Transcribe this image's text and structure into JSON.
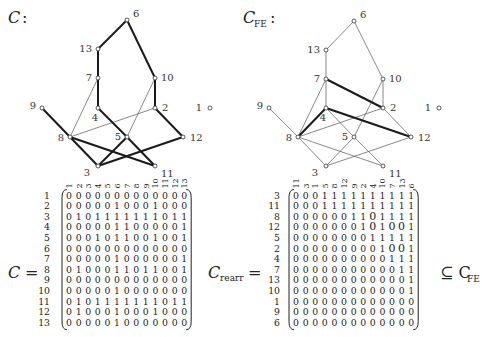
{
  "left_graph": {
    "title": "C",
    "title_suffix": ":",
    "nodes": [
      {
        "id": "6",
        "x": 127,
        "y": 20
      },
      {
        "id": "13",
        "x": 98,
        "y": 49
      },
      {
        "id": "7",
        "x": 98,
        "y": 78
      },
      {
        "id": "10",
        "x": 155,
        "y": 78
      },
      {
        "id": "9",
        "x": 42,
        "y": 108
      },
      {
        "id": "4",
        "x": 98,
        "y": 108
      },
      {
        "id": "2",
        "x": 155,
        "y": 108
      },
      {
        "id": "1",
        "x": 210,
        "y": 108
      },
      {
        "id": "8",
        "x": 70,
        "y": 137
      },
      {
        "id": "5",
        "x": 127,
        "y": 137
      },
      {
        "id": "12",
        "x": 183,
        "y": 137
      },
      {
        "id": "3",
        "x": 98,
        "y": 166
      },
      {
        "id": "11",
        "x": 155,
        "y": 166
      }
    ],
    "thick_edges": [
      [
        "6",
        "13"
      ],
      [
        "13",
        "7"
      ],
      [
        "7",
        "4"
      ],
      [
        "6",
        "10"
      ],
      [
        "10",
        "2"
      ],
      [
        "9",
        "8"
      ],
      [
        "4",
        "5"
      ],
      [
        "5",
        "11"
      ],
      [
        "2",
        "12"
      ],
      [
        "8",
        "3"
      ],
      [
        "8",
        "11"
      ],
      [
        "5",
        "3"
      ],
      [
        "3",
        "12"
      ]
    ],
    "thin_edges": [
      [
        "7",
        "8"
      ],
      [
        "8",
        "2"
      ],
      [
        "10",
        "5"
      ]
    ]
  },
  "right_graph": {
    "title": "C",
    "title_subscript": "FE",
    "title_suffix": ":",
    "nodes": [
      {
        "id": "6",
        "x": 354,
        "y": 21
      },
      {
        "id": "13",
        "x": 326,
        "y": 50
      },
      {
        "id": "7",
        "x": 326,
        "y": 79
      },
      {
        "id": "10",
        "x": 383,
        "y": 79
      },
      {
        "id": "9",
        "x": 269,
        "y": 108
      },
      {
        "id": "4",
        "x": 326,
        "y": 108
      },
      {
        "id": "2",
        "x": 383,
        "y": 108
      },
      {
        "id": "1",
        "x": 439,
        "y": 108
      },
      {
        "id": "8",
        "x": 298,
        "y": 137
      },
      {
        "id": "5",
        "x": 354,
        "y": 137
      },
      {
        "id": "12",
        "x": 411,
        "y": 137
      },
      {
        "id": "3",
        "x": 326,
        "y": 166
      },
      {
        "id": "11",
        "x": 383,
        "y": 166
      }
    ],
    "thick_edges": [
      [
        "7",
        "2"
      ],
      [
        "4",
        "12"
      ],
      [
        "4",
        "8"
      ]
    ],
    "thin_edges": [
      [
        "6",
        "13"
      ],
      [
        "6",
        "10"
      ],
      [
        "13",
        "7"
      ],
      [
        "7",
        "4"
      ],
      [
        "7",
        "8"
      ],
      [
        "10",
        "2"
      ],
      [
        "9",
        "8"
      ],
      [
        "4",
        "5"
      ],
      [
        "5",
        "11"
      ],
      [
        "8",
        "2"
      ],
      [
        "8",
        "3"
      ],
      [
        "8",
        "11"
      ],
      [
        "3",
        "12"
      ],
      [
        "2",
        "12"
      ],
      [
        "5",
        "3"
      ],
      [
        "10",
        "5"
      ]
    ]
  },
  "left_matrix": {
    "lhs": "C",
    "eq": "=",
    "col_labels": [
      "1",
      "2",
      "3",
      "4",
      "5",
      "6",
      "7",
      "8",
      "9",
      "10",
      "11",
      "12",
      "13"
    ],
    "row_labels": [
      "1",
      "2",
      "3",
      "4",
      "5",
      "6",
      "7",
      "8",
      "9",
      "10",
      "11",
      "12",
      "13"
    ],
    "rows": [
      "0000000000000",
      "0000010001000",
      "0101111111011",
      "0000011000001",
      "0001011001001",
      "0000000000000",
      "0000010000001",
      "0100011011001",
      "0000000000000",
      "0000010000000",
      "0101111111011",
      "0100010001000",
      "0000010000000"
    ]
  },
  "right_matrix": {
    "lhs": "C",
    "lhs_subscript": "rearr",
    "eq": "=",
    "rhs": "⊆ C",
    "rhs_subscript": "FE",
    "col_labels": [
      "11",
      "3",
      "1",
      "5",
      "8",
      "12",
      "9",
      "2",
      "4",
      "10",
      "7",
      "13",
      "6"
    ],
    "row_labels": [
      "3",
      "11",
      "8",
      "12",
      "5",
      "2",
      "4",
      "7",
      "13",
      "10",
      "1",
      "9",
      "6"
    ],
    "rows": [
      "0001111111111",
      "0001111111111",
      "000000110O1111",
      "0000000101O1OO1",
      "0000000001111 1",
      "00000000001OO1",
      "0000000000111",
      "0000000000011",
      "0000000000001",
      "0000000000001",
      "0000000000000",
      "0000000000000",
      "0000000000000"
    ],
    "cells": [
      [
        "0",
        "0",
        "0",
        "1",
        "1",
        "1",
        "1",
        "1",
        "1",
        "1",
        "1",
        "1",
        "1"
      ],
      [
        "0",
        "0",
        "0",
        "1",
        "1",
        "1",
        "1",
        "1",
        "1",
        "1",
        "1",
        "1",
        "1"
      ],
      [
        "0",
        "0",
        "0",
        "0",
        "0",
        "0",
        "1",
        "1",
        "O",
        "1",
        "1",
        "1",
        "1"
      ],
      [
        "0",
        "0",
        "0",
        "0",
        "0",
        "0",
        "0",
        "1",
        "O",
        "1",
        "O",
        "O",
        "1"
      ],
      [
        "0",
        "0",
        "0",
        "0",
        "0",
        "0",
        "0",
        "0",
        "1",
        "1",
        "1",
        "1",
        "1"
      ],
      [
        "0",
        "0",
        "0",
        "0",
        "0",
        "0",
        "0",
        "0",
        "0",
        "1",
        "O",
        "O",
        "1"
      ],
      [
        "0",
        "0",
        "0",
        "0",
        "0",
        "0",
        "0",
        "0",
        "0",
        "0",
        "1",
        "1",
        "1"
      ],
      [
        "0",
        "0",
        "0",
        "0",
        "0",
        "0",
        "0",
        "0",
        "0",
        "0",
        "0",
        "1",
        "1"
      ],
      [
        "0",
        "0",
        "0",
        "0",
        "0",
        "0",
        "0",
        "0",
        "0",
        "0",
        "0",
        "0",
        "1"
      ],
      [
        "0",
        "0",
        "0",
        "0",
        "0",
        "0",
        "0",
        "0",
        "0",
        "0",
        "0",
        "0",
        "1"
      ],
      [
        "0",
        "0",
        "0",
        "0",
        "0",
        "0",
        "0",
        "0",
        "0",
        "0",
        "0",
        "0",
        "0"
      ],
      [
        "0",
        "0",
        "0",
        "0",
        "0",
        "0",
        "0",
        "0",
        "0",
        "0",
        "0",
        "0",
        "0"
      ],
      [
        "0",
        "0",
        "0",
        "0",
        "0",
        "0",
        "0",
        "0",
        "0",
        "0",
        "0",
        "0",
        "0"
      ]
    ]
  }
}
